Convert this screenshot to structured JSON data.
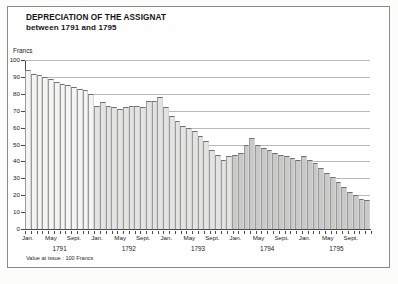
{
  "title": {
    "line1": "DEPRECIATION OF THE ASSIGNAT",
    "line2": "between 1791 and 1795"
  },
  "footnote": "Value at issue : 100 Francs",
  "axis": {
    "y_label": "Francs",
    "y_ticks": [
      100,
      90,
      80,
      70,
      60,
      50,
      40,
      30,
      20,
      10,
      0
    ],
    "x_month_labels": [
      "Jan.",
      "May",
      "Sept."
    ],
    "x_year_labels": [
      "1791",
      "1792",
      "1793",
      "1794",
      "1795"
    ]
  },
  "colors": {
    "band_1791": "#f4f4f2",
    "band_1792_1793": "#e3e3e1",
    "band_1794_1795": "#c9c9c7",
    "grid": "#b9b9b9",
    "axis": "#4a4a4a",
    "text": "#1a1a1a",
    "frame": "#8a8a8a"
  },
  "chart_data": {
    "type": "bar",
    "title": "DEPRECIATION OF THE ASSIGNAT between 1791 and 1795",
    "xlabel": "",
    "ylabel": "Francs",
    "ylim": [
      0,
      100
    ],
    "grid": true,
    "legend": "none",
    "annotation": "Value at issue : 100 Francs",
    "categories": [
      "Jan. 1791",
      "Feb. 1791",
      "Mar. 1791",
      "Apr. 1791",
      "May 1791",
      "June 1791",
      "July 1791",
      "Aug. 1791",
      "Sept. 1791",
      "Oct. 1791",
      "Nov. 1791",
      "Dec. 1791",
      "Jan. 1792",
      "Feb. 1792",
      "Mar. 1792",
      "Apr. 1792",
      "May 1792",
      "June 1792",
      "July 1792",
      "Aug. 1792",
      "Sept. 1792",
      "Oct. 1792",
      "Nov. 1792",
      "Dec. 1792",
      "Jan. 1793",
      "Feb. 1793",
      "Mar. 1793",
      "Apr. 1793",
      "May 1793",
      "June 1793",
      "July 1793",
      "Aug. 1793",
      "Sept. 1793",
      "Oct. 1793",
      "Nov. 1793",
      "Dec. 1793",
      "Jan. 1794",
      "Feb. 1794",
      "Mar. 1794",
      "Apr. 1794",
      "May 1794",
      "June 1794",
      "July 1794",
      "Aug. 1794",
      "Sept. 1794",
      "Oct. 1794",
      "Nov. 1794",
      "Dec. 1794",
      "Jan. 1795",
      "Feb. 1795",
      "Mar. 1795",
      "Apr. 1795",
      "May 1795",
      "June 1795",
      "July 1795",
      "Aug. 1795",
      "Sept. 1795",
      "Oct. 1795",
      "Nov. 1795",
      "Dec. 1795"
    ],
    "values": [
      94,
      92,
      91,
      90,
      89,
      87,
      86,
      85,
      84,
      83,
      82,
      80,
      73,
      75,
      73,
      72,
      71,
      72,
      73,
      73,
      72,
      76,
      76,
      78,
      72,
      67,
      64,
      61,
      60,
      58,
      55,
      52,
      47,
      44,
      41,
      43,
      44,
      45,
      50,
      54,
      50,
      48,
      47,
      45,
      44,
      43,
      42,
      41,
      43,
      41,
      39,
      36,
      33,
      31,
      28,
      25,
      22,
      20,
      18,
      17
    ],
    "values_note": "monthly value of the 100-franc assignat in francs",
    "series": [
      {
        "name": "Assignat value (Francs)",
        "values": [
          94,
          92,
          91,
          90,
          89,
          87,
          86,
          85,
          84,
          83,
          82,
          80,
          73,
          75,
          73,
          72,
          71,
          72,
          73,
          73,
          72,
          76,
          76,
          78,
          72,
          67,
          64,
          61,
          60,
          58,
          55,
          52,
          47,
          44,
          41,
          43,
          44,
          45,
          50,
          54,
          50,
          48,
          47,
          45,
          44,
          43,
          42,
          41,
          43,
          41,
          39,
          36,
          33,
          31,
          28,
          25,
          22,
          20,
          18,
          17
        ]
      }
    ]
  }
}
